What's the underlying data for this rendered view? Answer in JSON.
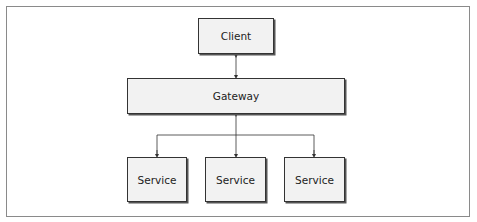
{
  "diagram": {
    "nodes": {
      "client": "Client",
      "gateway": "Gateway",
      "services": [
        "Service",
        "Service",
        "Service"
      ]
    },
    "edges": [
      {
        "from": "client",
        "to": "gateway",
        "type": "bidirectional"
      },
      {
        "from": "gateway",
        "to": "service-1",
        "type": "arrow"
      },
      {
        "from": "gateway",
        "to": "service-2",
        "type": "arrow"
      },
      {
        "from": "gateway",
        "to": "service-3",
        "type": "arrow"
      }
    ],
    "colors": {
      "box_fill": "#f2f2f2",
      "border": "#333333",
      "frame": "#8a8a8a"
    }
  }
}
